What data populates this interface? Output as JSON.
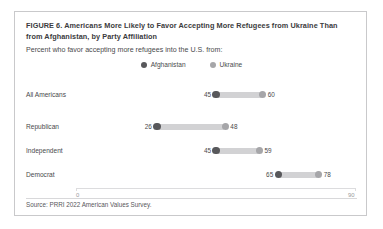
{
  "figure": {
    "title": "FIGURE 6.  Americans More Likely to Favor Accepting More Refugees from Ukraine Than from Afghanistan, by Party Affiliation",
    "subtitle": "Percent who favor accepting more refugees into the U.S. from:",
    "source": "Source: PRRI 2022 American Values Survey."
  },
  "colors": {
    "afghanistan": "#58585b",
    "ukraine": "#a6a6a9",
    "connector": "#d2d2d4",
    "border": "#c9c9cb",
    "text": "#4a4a4c"
  },
  "chart_data": {
    "type": "bar",
    "subtype": "dumbbell",
    "title": "FIGURE 6.  Americans More Likely to Favor Accepting More Refugees from Ukraine Than from Afghanistan, by Party Affiliation",
    "subtitle": "Percent who favor accepting more refugees into the U.S. from:",
    "xlabel": "",
    "ylabel": "",
    "xlim": [
      0,
      90
    ],
    "xticks": [
      0,
      90
    ],
    "xtick_labels": [
      "0",
      "90"
    ],
    "grid": false,
    "legend_position": "top-center",
    "categories": [
      "All Americans",
      "Republican",
      "Independent",
      "Democrat"
    ],
    "series": [
      {
        "name": "Afghanistan",
        "color": "#58585b",
        "values": [
          45,
          26,
          45,
          65
        ]
      },
      {
        "name": "Ukraine",
        "color": "#a6a6a9",
        "values": [
          60,
          48,
          59,
          78
        ]
      }
    ],
    "rows": [
      {
        "label": "All Americans",
        "afghanistan": 45,
        "ukraine": 60
      },
      {
        "label": "Republican",
        "afghanistan": 26,
        "ukraine": 48
      },
      {
        "label": "Independent",
        "afghanistan": 45,
        "ukraine": 59
      },
      {
        "label": "Democrat",
        "afghanistan": 65,
        "ukraine": 78
      }
    ],
    "source": "Source: PRRI 2022 American Values Survey."
  }
}
